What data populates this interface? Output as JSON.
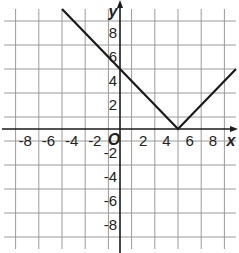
{
  "chart_data": {
    "type": "line",
    "title": "",
    "function": "y = |x - 5|",
    "xlabel": "x",
    "ylabel": "y",
    "origin_label": "O",
    "xlim": [
      -10,
      10
    ],
    "ylim": [
      -10,
      10
    ],
    "grid": true,
    "grid_step": 2,
    "x_ticks": [
      -8,
      -6,
      -4,
      -2,
      2,
      4,
      6,
      8
    ],
    "y_ticks": [
      8,
      6,
      4,
      2,
      -2,
      -4,
      -6,
      -8
    ],
    "series": [
      {
        "name": "absolute value graph",
        "points": [
          [
            -5,
            10
          ],
          [
            0,
            5
          ],
          [
            5,
            0
          ],
          [
            10,
            5
          ]
        ],
        "color": "#1a1a1a"
      }
    ],
    "key_points": {
      "vertex": [
        5,
        0
      ],
      "y_intercept": [
        0,
        5
      ]
    }
  },
  "colors": {
    "grid": "#9a9a9a",
    "axis": "#1a1a1a",
    "line": "#1a1a1a",
    "background": "#ffffff"
  }
}
